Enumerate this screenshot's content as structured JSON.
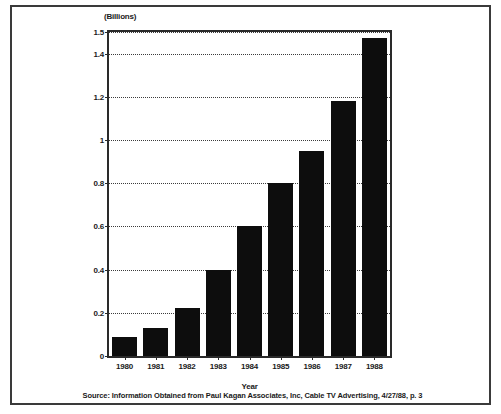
{
  "chart_data": {
    "type": "bar",
    "title": "",
    "units_caption": "(Billions)",
    "xlabel": "Year",
    "ylabel": "",
    "categories": [
      "1980",
      "1981",
      "1982",
      "1983",
      "1984",
      "1985",
      "1986",
      "1987",
      "1988"
    ],
    "values": [
      0.09,
      0.13,
      0.22,
      0.4,
      0.6,
      0.8,
      0.95,
      1.18,
      1.47
    ],
    "ylim": [
      0,
      1.5
    ],
    "yticks": [
      0,
      0.2,
      0.4,
      0.6,
      0.8,
      1,
      1.2,
      1.4,
      1.5
    ],
    "ytick_labels": [
      "0",
      "0.2",
      "0.4",
      "0.6",
      "0.8",
      "1",
      "1.2",
      "1.4",
      "1.5"
    ],
    "grid": true,
    "grid_style": "dotted",
    "legend": "none",
    "bar_color": "#0d0d0d",
    "series": [
      {
        "name": "Cable TV Advertising Revenue",
        "values": [
          0.09,
          0.13,
          0.22,
          0.4,
          0.6,
          0.8,
          0.95,
          1.18,
          1.47
        ]
      }
    ]
  },
  "footer": {
    "source": "Source: Information Obtained from Paul Kagan Associates, Inc, Cable TV Advertising, 4/27/88, p. 3"
  }
}
